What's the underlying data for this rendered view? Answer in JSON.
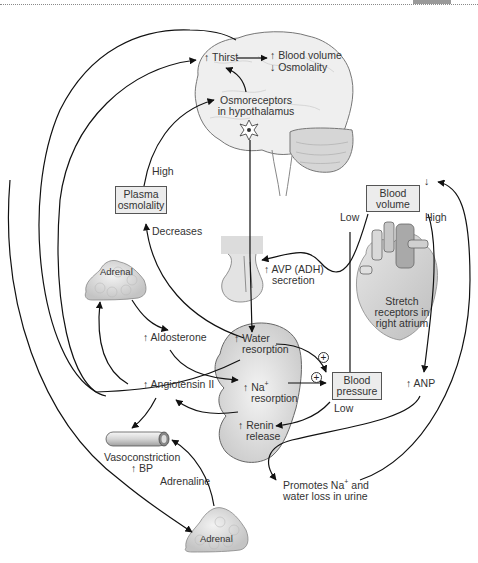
{
  "diagram": {
    "type": "physiology-flowchart",
    "nodes": {
      "thirst": "↑ Thirst",
      "blood_volume_up": "↑ Blood volume",
      "osmolality_down": "↓ Osmolality",
      "osmoreceptors_line1": "Osmoreceptors",
      "osmoreceptors_line2": "in hypothalamus",
      "plasma_osmolality_line1": "Plasma",
      "plasma_osmolality_line2": "osmolality",
      "blood_volume_box_line1": "Blood",
      "blood_volume_box_line2": "volume",
      "blood_volume_down_arrow": "↓",
      "stretch_receptors_line1": "Stretch",
      "stretch_receptors_line2": "receptors in",
      "stretch_receptors_line3": "right atrium",
      "avp_line1": "↑ AVP (ADH)",
      "avp_line2": "secretion",
      "adrenal_top": "Adrenal",
      "adrenal_bottom": "Adrenal",
      "aldosterone": "↑ Aldosterone",
      "angiotensin": "↑ Angiotensin II",
      "water_resorption_line1": "↑ Water",
      "water_resorption_line2": "resorption",
      "na_resorption_line1": "↑ Na",
      "na_resorption_sup": "+",
      "na_resorption_line2": "resorption",
      "renin_line1": "↑ Renin",
      "renin_line2": "release",
      "blood_pressure_line1": "Blood",
      "blood_pressure_line2": "pressure",
      "anp": "↑ ANP",
      "vasoconstriction_line1": "Vasoconstriction",
      "vasoconstriction_line2": "↑ BP",
      "promotes_line1": "Promotes Na",
      "promotes_sup": "+",
      "promotes_line1_end": " and",
      "promotes_line2": "water loss in urine"
    },
    "edge_labels": {
      "high_plasma": "High",
      "decreases": "Decreases",
      "low_blood_volume": "Low",
      "high_blood_volume": "High",
      "low_blood_pressure": "Low",
      "adrenaline": "Adrenaline",
      "plus_1": "+",
      "plus_2": "+"
    },
    "edges": [
      {
        "from": "Osmoreceptors in hypothalamus",
        "to": "Thirst"
      },
      {
        "from": "Thirst",
        "to": "Blood volume / Osmolality"
      },
      {
        "from": "Plasma osmolality",
        "to": "Osmoreceptors in hypothalamus",
        "label": "High"
      },
      {
        "from": "Water resorption",
        "to": "Plasma osmolality",
        "label": "Decreases"
      },
      {
        "from": "Osmoreceptors in hypothalamus",
        "to": "Water resorption",
        "via": "AVP (ADH) secretion"
      },
      {
        "from": "Stretch receptors in right atrium",
        "to": "AVP (ADH) secretion",
        "label": "Low"
      },
      {
        "from": "Blood volume",
        "to": "ANP",
        "label": "High"
      },
      {
        "from": "Adrenal",
        "to": "Aldosterone"
      },
      {
        "from": "Aldosterone",
        "to": "Na+ resorption"
      },
      {
        "from": "Angiotensin II",
        "to": "Adrenal"
      },
      {
        "from": "Angiotensin II",
        "to": "Thirst"
      },
      {
        "from": "Angiotensin II",
        "to": "Vasoconstriction"
      },
      {
        "from": "Angiotensin II",
        "to": "Adrenal (lower)"
      },
      {
        "from": "Renin release",
        "to": "Angiotensin II"
      },
      {
        "from": "Water resorption",
        "to": "Blood pressure",
        "sign": "+"
      },
      {
        "from": "Na+ resorption",
        "to": "Blood pressure",
        "sign": "+"
      },
      {
        "from": "Blood pressure",
        "to": "Renin release",
        "label": "Low"
      },
      {
        "from": "Adrenal (lower)",
        "to": "Vasoconstriction",
        "label": "Adrenaline"
      },
      {
        "from": "ANP",
        "to": "Promotes Na+ and water loss in urine"
      },
      {
        "from": "Promotes Na+ and water loss in urine",
        "to": "Blood volume"
      }
    ]
  }
}
